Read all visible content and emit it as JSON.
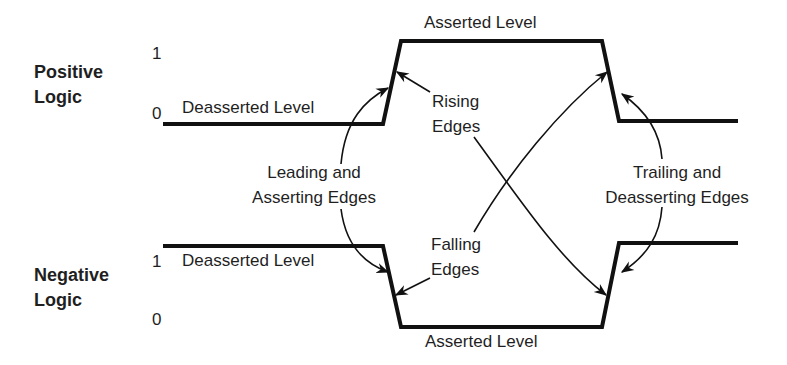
{
  "diagram": {
    "positive": {
      "title_line1": "Positive",
      "title_line2": "Logic",
      "level_1": "1",
      "level_0": "0",
      "deasserted_label": "Deasserted Level",
      "asserted_label": "Asserted Level"
    },
    "negative": {
      "title_line1": "Negative",
      "title_line2": "Logic",
      "level_1": "1",
      "level_0": "0",
      "deasserted_label": "Deasserted Level",
      "asserted_label": "Asserted Level"
    },
    "annotations": {
      "rising_line1": "Rising",
      "rising_line2": "Edges",
      "falling_line1": "Falling",
      "falling_line2": "Edges",
      "leading_line1": "Leading and",
      "leading_line2": "Asserting Edges",
      "trailing_line1": "Trailing and",
      "trailing_line2": "Deasserting Edges"
    },
    "colors": {
      "line": "#111111",
      "text": "#1f1f1f",
      "background": "#ffffff"
    }
  }
}
